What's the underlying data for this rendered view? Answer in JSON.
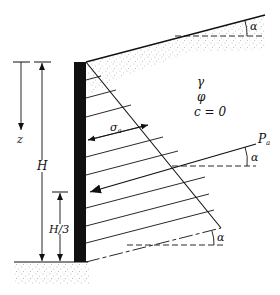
{
  "figure": {
    "type": "retaining-wall-active-earth-pressure",
    "labels": {
      "unit_weight": "γ",
      "friction_angle": "φ",
      "cohesion": "c = 0",
      "depth": "z",
      "wall_height": "H",
      "resultant_height": "H/3",
      "active_pressure": "σa",
      "active_pressure_symbol": "σ",
      "active_pressure_sub": "a",
      "resultant_force": "Pa",
      "resultant_force_symbol": "P",
      "resultant_force_sub": "a",
      "backfill_slope_angle": "α",
      "resultant_angle": "α",
      "base_angle": "α"
    },
    "colors": {
      "ink": "#111111",
      "wall": "#111111",
      "soil_stipple": "#555555",
      "background": "#ffffff"
    }
  }
}
